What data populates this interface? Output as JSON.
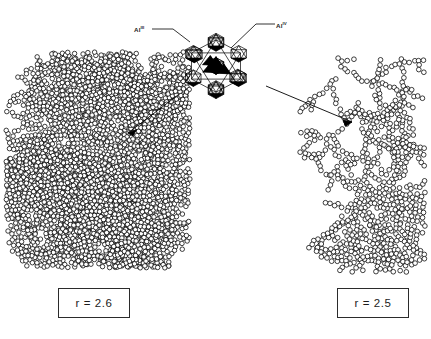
{
  "figure": {
    "background_color": "#ffffff",
    "ink_color": "#000000",
    "width": 431,
    "height": 339
  },
  "labels": {
    "al_iii": "Al",
    "al_iii_sup": "III",
    "al_iv": "Al",
    "al_iv_sup": "IV"
  },
  "boxes": {
    "left": {
      "text": "r = 2.6",
      "value": 2.6,
      "symbol": "r"
    },
    "right": {
      "text": "r = 2.5",
      "value": 2.5,
      "symbol": "r"
    }
  },
  "aggregates": {
    "left": {
      "name": "dense-branched-aggregate",
      "fractal_dimension": 2.6,
      "particle_count": 980,
      "description": "dense multi-branched fractal cluster of small open circles"
    },
    "right": {
      "name": "sparse-chain-aggregate",
      "fractal_dimension": 2.5,
      "particle_count": 300,
      "description": "sparse chain-like fractal cluster of small open circles"
    }
  },
  "keggin": {
    "name": "al13-keggin-polycation",
    "description": "polyhedral cluster of linked octahedra and tetrahedra with black-filled faces"
  },
  "leaders": {
    "al_iii": "leader line from Al III label to upper-left octahedron",
    "al_iv": "leader line from Al IV label to central tetrahedron"
  },
  "arrows": {
    "left": "arrow from Keggin cluster down-left to dense aggregate",
    "right": "arrow from Keggin cluster down-right to sparse aggregate"
  },
  "chart_data": {
    "type": "scatter",
    "xlabel": "",
    "ylabel": "",
    "categories": [
      "r = 2.6",
      "r = 2.5"
    ],
    "values": [
      2.6,
      2.5
    ],
    "annotations": [
      "Al III",
      "Al IV",
      "r = 2.6",
      "r = 2.5"
    ],
    "legend": []
  }
}
